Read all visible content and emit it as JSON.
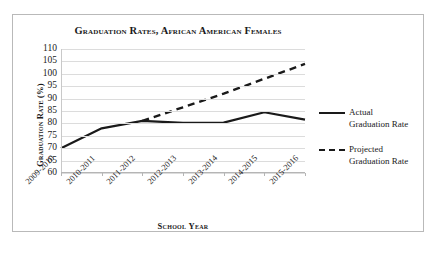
{
  "chart_data": {
    "type": "line",
    "title": "Graduation Rates, African American Females",
    "xlabel": "School Year",
    "ylabel": "Graduation Rate (%)",
    "categories": [
      "2009-2010",
      "2010-2011",
      "2011-2012",
      "2012-2013",
      "2013-2014",
      "2014-2015",
      "2015-2016"
    ],
    "ylim": [
      60,
      110
    ],
    "yticks": [
      60,
      65,
      70,
      75,
      80,
      85,
      90,
      95,
      100,
      105,
      110
    ],
    "grid": true,
    "legend_position": "right",
    "series": [
      {
        "name": "Actual Graduation Rate",
        "style": "solid",
        "color": "#1a1a1a",
        "values": [
          70,
          78,
          81,
          80.2,
          80.3,
          84.5,
          81.5
        ]
      },
      {
        "name": "Projected Graduation Rate",
        "style": "dashed",
        "color": "#1a1a1a",
        "values": [
          null,
          null,
          81,
          86.5,
          92,
          98,
          104
        ]
      }
    ]
  },
  "legend": {
    "entries": [
      {
        "label_line1": "Actual",
        "label_line2": "Graduation Rate",
        "style": "solid"
      },
      {
        "label_line1": "Projected",
        "label_line2": "Graduation Rate",
        "style": "dashed"
      }
    ]
  }
}
